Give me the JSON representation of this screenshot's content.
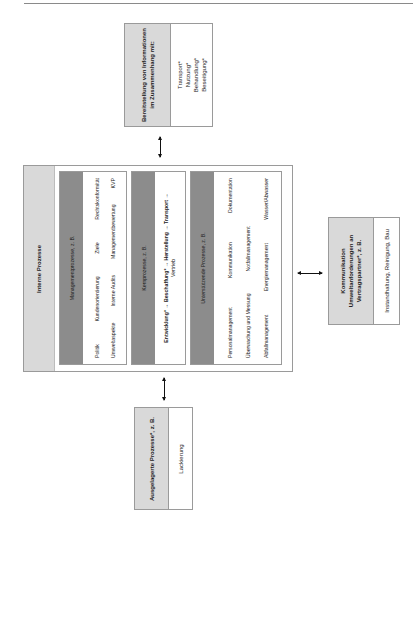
{
  "info_box": {
    "header": "Bereitstellung von Informationen im Zusammenhang mit:",
    "header_lines": [
      "Bereitstellung von Informationen",
      "im Zusammenhang mit:"
    ],
    "items": [
      "Transport*",
      "Nutzung*",
      "Behandlung*",
      "Beseitigung*"
    ]
  },
  "internal": {
    "title": "Interne Prozesse",
    "management": {
      "header": "Managementprozesse, z. B.",
      "row1": [
        "Politik",
        "Kundenorientierung",
        "Ziele",
        "Rechtskonformität"
      ],
      "row2": [
        "Umweltaspekte",
        "Interne Audits",
        "Managementbewertung",
        "KVP"
      ]
    },
    "core": {
      "header": "Kernprozesse, z. B.",
      "line1": "Entwicklung* → Beschaffung* → Herstellung → Transport →",
      "line2": "Vertrieb"
    },
    "support": {
      "header": "Unterstützende Prozesse, z. B.",
      "row1": [
        "Personalmanagement",
        "Kommunikation",
        "Dokumentation"
      ],
      "row2": [
        "Überwachung und Messung",
        "Notfallmanagement"
      ],
      "row3": [
        "Abfallmanagement",
        "Energiemanagement",
        "Wasser/Abwasser"
      ]
    }
  },
  "communication_box": {
    "header_lines": [
      "Kommunikation",
      "Umweltanforderungen an",
      "Vertragspartner*, z. B."
    ],
    "content": "Instandhaltung, Reinigung, Bau"
  },
  "outsourced_box": {
    "header": "Ausgelagerte Prozesse*, z. B.",
    "content": "Lackierung"
  },
  "colors": {
    "header_grey": "#d9d9d9",
    "dark_grey": "#8c8c8c",
    "border": "#9a9a9a"
  }
}
